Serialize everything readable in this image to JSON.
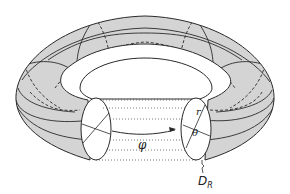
{
  "diagram": {
    "colors": {
      "fill": "#d4d4d4",
      "stroke": "#2a2a2a",
      "background": "#ffffff"
    },
    "labels": {
      "phi": "φ",
      "r": "r",
      "theta": "θ",
      "d_main": "D",
      "d_sub": "R"
    }
  }
}
